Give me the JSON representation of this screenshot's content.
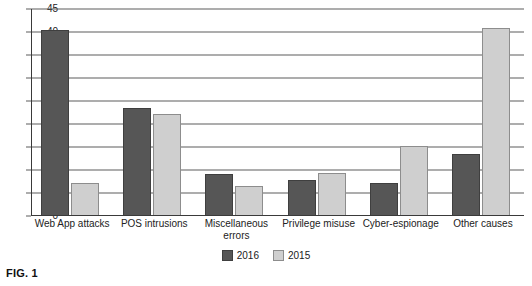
{
  "caption": "FIG. 1",
  "legend": {
    "items": [
      {
        "label": "2016",
        "color": "#565656"
      },
      {
        "label": "2015",
        "color": "#cfcfcf"
      }
    ]
  },
  "chart_data": {
    "type": "bar",
    "title": "",
    "xlabel": "",
    "ylabel": "",
    "ylim": [
      0,
      45
    ],
    "ytick_step": 5,
    "yticks": [
      0,
      5,
      10,
      15,
      20,
      25,
      30,
      35,
      40,
      45
    ],
    "grid": true,
    "grid_axis": "y",
    "legend_position": "bottom-center",
    "categories": [
      "Web App attacks",
      "POS intrusions",
      "Miscellaneous errors",
      "Privilege misuse",
      "Cyber-espionage",
      "Other causes"
    ],
    "series": [
      {
        "name": "2016",
        "color": "#565656",
        "values": [
          40,
          23,
          8.7,
          7.4,
          6.7,
          13.1
        ]
      },
      {
        "name": "2015",
        "color": "#cfcfcf",
        "values": [
          6.8,
          21.8,
          6,
          8.9,
          14.8,
          40.5
        ]
      }
    ]
  }
}
